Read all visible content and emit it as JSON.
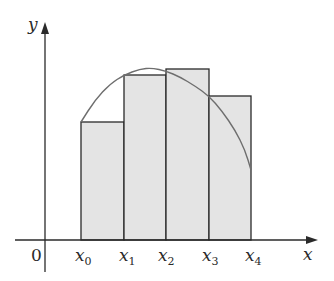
{
  "diagram": {
    "title": "",
    "colors": {
      "axis": "#2a2a2a",
      "rect_fill": "#e4e4e4",
      "rect_stroke": "#2a2a2a",
      "curve": "#6e6e6e",
      "background": "#ffffff"
    },
    "axes": {
      "x_label": "x",
      "y_label": "y",
      "origin_label": "0"
    },
    "tick_labels": [
      {
        "base": "x",
        "sub": "0"
      },
      {
        "base": "x",
        "sub": "1"
      },
      {
        "base": "x",
        "sub": "2"
      },
      {
        "base": "x",
        "sub": "3"
      },
      {
        "base": "x",
        "sub": "4"
      }
    ],
    "rectangles": [
      {
        "x_left": 81,
        "x_right": 124,
        "top": 122
      },
      {
        "x_left": 124,
        "x_right": 166,
        "top": 75
      },
      {
        "x_left": 166,
        "x_right": 209,
        "top": 69
      },
      {
        "x_left": 209,
        "x_right": 251,
        "top": 96
      }
    ],
    "curve_points": [
      [
        81,
        122
      ],
      [
        95,
        100
      ],
      [
        110,
        84
      ],
      [
        124,
        75
      ],
      [
        140,
        69
      ],
      [
        152,
        68
      ],
      [
        166,
        71
      ],
      [
        180,
        77
      ],
      [
        195,
        86
      ],
      [
        209,
        96
      ],
      [
        222,
        111
      ],
      [
        235,
        130
      ],
      [
        245,
        150
      ],
      [
        251,
        170
      ]
    ],
    "x_axis": {
      "y": 240,
      "x_start": 15,
      "x_end": 318
    },
    "y_axis": {
      "x": 45,
      "y_start": 272,
      "y_end": 22
    }
  }
}
